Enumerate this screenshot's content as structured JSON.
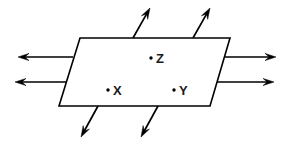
{
  "figure": {
    "title": "",
    "background_color": "#ffffff",
    "line_color": "#000000",
    "width": 290,
    "height": 152
  },
  "plane": {
    "name": "parallelogram-plane",
    "corners": [
      {
        "x": 80,
        "y": 38
      },
      {
        "x": 230,
        "y": 38
      },
      {
        "x": 210,
        "y": 106
      },
      {
        "x": 59,
        "y": 106
      }
    ],
    "fill": "#ffffff",
    "stroke": "#000000"
  },
  "points": [
    {
      "id": "point-z",
      "label": "Z",
      "dot": {
        "x": 151,
        "y": 58
      },
      "text": {
        "x": 156,
        "y": 63
      }
    },
    {
      "id": "point-x",
      "label": "X",
      "dot": {
        "x": 108,
        "y": 90
      },
      "text": {
        "x": 113,
        "y": 95
      }
    },
    {
      "id": "point-y",
      "label": "Y",
      "dot": {
        "x": 174,
        "y": 90
      },
      "text": {
        "x": 179,
        "y": 95
      }
    }
  ],
  "arrows": [
    {
      "id": "arrow-left-upper",
      "direction": "left",
      "from": {
        "x": 73,
        "y": 57
      },
      "to": {
        "x": 18,
        "y": 57
      }
    },
    {
      "id": "arrow-left-lower",
      "direction": "left",
      "from": {
        "x": 66,
        "y": 82
      },
      "to": {
        "x": 15,
        "y": 82
      }
    },
    {
      "id": "arrow-right-upper",
      "direction": "right",
      "from": {
        "x": 224,
        "y": 57
      },
      "to": {
        "x": 276,
        "y": 57
      }
    },
    {
      "id": "arrow-right-lower",
      "direction": "right",
      "from": {
        "x": 217,
        "y": 82
      },
      "to": {
        "x": 274,
        "y": 82
      }
    },
    {
      "id": "arrow-top-left",
      "direction": "up-right",
      "from": {
        "x": 133,
        "y": 38
      },
      "to": {
        "x": 150,
        "y": 8
      }
    },
    {
      "id": "arrow-top-right",
      "direction": "up-right",
      "from": {
        "x": 193,
        "y": 38
      },
      "to": {
        "x": 210,
        "y": 8
      }
    },
    {
      "id": "arrow-bottom-left",
      "direction": "down-left",
      "from": {
        "x": 98,
        "y": 106
      },
      "to": {
        "x": 81,
        "y": 137
      }
    },
    {
      "id": "arrow-bottom-right",
      "direction": "down-left",
      "from": {
        "x": 158,
        "y": 106
      },
      "to": {
        "x": 141,
        "y": 137
      }
    }
  ]
}
